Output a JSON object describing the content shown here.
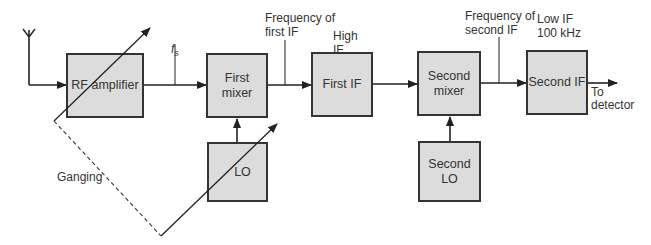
{
  "diagram": {
    "type": "superheterodyne double-conversion receiver block diagram",
    "blocks": {
      "rf_amplifier": "RF amplifier",
      "first_mixer": "First\nmixer",
      "lo": "LO",
      "first_if": "First IF",
      "second_mixer": "Second\nmixer",
      "second_lo": "Second\nLO",
      "second_if": "Second IF"
    },
    "labels": {
      "fs": "f",
      "fs_sub": "s",
      "freq_first_if": "Frequency of\nfirst IF",
      "high_if": "High\nIF",
      "freq_second_if": "Frequency of\nsecond IF",
      "low_if": "Low IF\n100 kHz",
      "to_detector": "To\ndetector",
      "ganging": "Ganging"
    },
    "colors": {
      "block_fill": "#dcdcdc",
      "line": "#222222"
    }
  }
}
